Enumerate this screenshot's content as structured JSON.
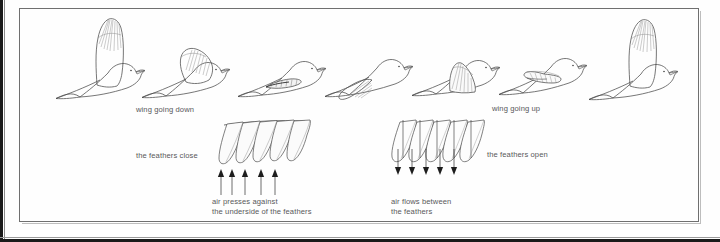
{
  "figure": {
    "frame_color": "#6f6f6f",
    "ink_color": "#4a4a4a",
    "label_color": "#58585a",
    "background": "#fefefe"
  },
  "labels": {
    "wing_down": "wing going down",
    "wing_up": "wing going up",
    "feathers_close": "the feathers close",
    "feathers_open": "the feathers open",
    "air_presses_line1": "air presses against",
    "air_presses_line2": "the underside of the feathers",
    "air_flows_line1": "air flows between",
    "air_flows_line2": "the feathers"
  },
  "sequence": {
    "count": 7,
    "frames": [
      {
        "index": 1,
        "wing": "fully raised",
        "phase": "downstroke-start"
      },
      {
        "index": 2,
        "wing": "half lowered",
        "phase": "downstroke"
      },
      {
        "index": 3,
        "wing": "fully lowered",
        "phase": "downstroke-end"
      },
      {
        "index": 4,
        "wing": "lowered-forward",
        "phase": "upstroke-start"
      },
      {
        "index": 5,
        "wing": "part raised",
        "phase": "upstroke"
      },
      {
        "index": 6,
        "wing": "folded back",
        "phase": "upstroke"
      },
      {
        "index": 7,
        "wing": "fully raised",
        "phase": "upstroke-end"
      }
    ]
  },
  "feather_diagrams": [
    {
      "name": "closed-feathers",
      "feather_count": 5,
      "arrow_count": 5,
      "arrow_direction": "up",
      "label": "the feathers close",
      "caption": "air presses against the underside of the feathers"
    },
    {
      "name": "open-feathers",
      "feather_count": 5,
      "arrow_count": 5,
      "arrow_direction": "down",
      "label": "the feathers open",
      "caption": "air flows between the feathers"
    }
  ]
}
